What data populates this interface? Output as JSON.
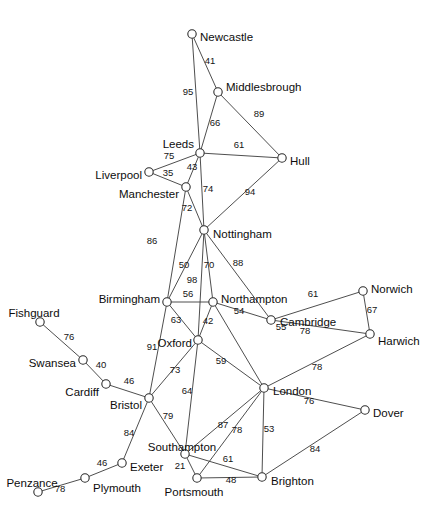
{
  "graph": {
    "title": "UK cities network graph",
    "node_radius": 4.2,
    "colors": {
      "background": "#ffffff",
      "edge": "#3a3a3a",
      "node_fill": "#ffffff",
      "node_stroke": "#2b2b2b",
      "label_text": "#0d0d0d",
      "weight_text": "#141414"
    },
    "nodes": [
      {
        "id": "newcastle",
        "label": "Newcastle",
        "x": 192,
        "y": 34,
        "lx": 200,
        "ly": 38,
        "anchor": "start"
      },
      {
        "id": "middlesbrough",
        "label": "Middlesbrough",
        "x": 218,
        "y": 92,
        "lx": 226,
        "ly": 88,
        "anchor": "start"
      },
      {
        "id": "leeds",
        "label": "Leeds",
        "x": 200,
        "y": 153,
        "lx": 194,
        "ly": 145,
        "anchor": "end"
      },
      {
        "id": "hull",
        "label": "Hull",
        "x": 282,
        "y": 158,
        "lx": 290,
        "ly": 162,
        "anchor": "start"
      },
      {
        "id": "liverpool",
        "label": "Liverpool",
        "x": 149,
        "y": 172,
        "lx": 142,
        "ly": 176,
        "anchor": "end"
      },
      {
        "id": "manchester",
        "label": "Manchester",
        "x": 186,
        "y": 187,
        "lx": 179,
        "ly": 195,
        "anchor": "end"
      },
      {
        "id": "nottingham",
        "label": "Nottingham",
        "x": 204,
        "y": 230,
        "lx": 213,
        "ly": 235,
        "anchor": "start"
      },
      {
        "id": "birmingham",
        "label": "Birmingham",
        "x": 167,
        "y": 302,
        "lx": 160,
        "ly": 300,
        "anchor": "end"
      },
      {
        "id": "northampton",
        "label": "Northampton",
        "x": 213,
        "y": 302,
        "lx": 221,
        "ly": 300,
        "anchor": "start"
      },
      {
        "id": "cambridge",
        "label": "Cambridge",
        "x": 271,
        "y": 320,
        "lx": 280,
        "ly": 323,
        "anchor": "start"
      },
      {
        "id": "norwich",
        "label": "Norwich",
        "x": 363,
        "y": 291,
        "lx": 371,
        "ly": 290,
        "anchor": "start"
      },
      {
        "id": "harwich",
        "label": "Harwich",
        "x": 370,
        "y": 334,
        "lx": 378,
        "ly": 342,
        "anchor": "start"
      },
      {
        "id": "oxford",
        "label": "Oxford",
        "x": 198,
        "y": 340,
        "lx": 192,
        "ly": 344,
        "anchor": "end"
      },
      {
        "id": "fishguard",
        "label": "Fishguard",
        "x": 40,
        "y": 322,
        "lx": 34,
        "ly": 314,
        "anchor": "middle"
      },
      {
        "id": "swansea",
        "label": "Swansea",
        "x": 83,
        "y": 360,
        "lx": 76,
        "ly": 364,
        "anchor": "end"
      },
      {
        "id": "cardiff",
        "label": "Cardiff",
        "x": 106,
        "y": 384,
        "lx": 99,
        "ly": 393,
        "anchor": "end"
      },
      {
        "id": "bristol",
        "label": "Bristol",
        "x": 149,
        "y": 398,
        "lx": 142,
        "ly": 406,
        "anchor": "end"
      },
      {
        "id": "london",
        "label": "London",
        "x": 264,
        "y": 388,
        "lx": 273,
        "ly": 392,
        "anchor": "start"
      },
      {
        "id": "dover",
        "label": "Dover",
        "x": 365,
        "y": 410,
        "lx": 373,
        "ly": 414,
        "anchor": "start"
      },
      {
        "id": "southampton",
        "label": "Southampton",
        "x": 185,
        "y": 454,
        "lx": 182,
        "ly": 448,
        "anchor": "middle"
      },
      {
        "id": "portsmouth",
        "label": "Portsmouth",
        "x": 197,
        "y": 478,
        "lx": 194,
        "ly": 493,
        "anchor": "middle"
      },
      {
        "id": "brighton",
        "label": "Brighton",
        "x": 262,
        "y": 477,
        "lx": 271,
        "ly": 482,
        "anchor": "start"
      },
      {
        "id": "exeter",
        "label": "Exeter",
        "x": 122,
        "y": 463,
        "lx": 130,
        "ly": 468,
        "anchor": "start"
      },
      {
        "id": "plymouth",
        "label": "Plymouth",
        "x": 85,
        "y": 478,
        "lx": 93,
        "ly": 489,
        "anchor": "start"
      },
      {
        "id": "penzance",
        "label": "Penzance",
        "x": 38,
        "y": 492,
        "lx": 32,
        "ly": 484,
        "anchor": "middle"
      }
    ],
    "edges": [
      {
        "from": "newcastle",
        "to": "middlesbrough",
        "weight": "41",
        "wx": 210,
        "wy": 64
      },
      {
        "from": "newcastle",
        "to": "leeds",
        "weight": "95",
        "wx": 188,
        "wy": 95
      },
      {
        "from": "middlesbrough",
        "to": "leeds",
        "weight": "66",
        "wx": 215,
        "wy": 126
      },
      {
        "from": "middlesbrough",
        "to": "hull",
        "weight": "89",
        "wx": 259,
        "wy": 117
      },
      {
        "from": "leeds",
        "to": "hull",
        "weight": "61",
        "wx": 239,
        "wy": 148
      },
      {
        "from": "leeds",
        "to": "liverpool",
        "weight": "75",
        "wx": 169,
        "wy": 159
      },
      {
        "from": "leeds",
        "to": "manchester",
        "weight": "43",
        "wx": 192,
        "wy": 170
      },
      {
        "from": "liverpool",
        "to": "manchester",
        "weight": "35",
        "wx": 168,
        "wy": 176
      },
      {
        "from": "leeds",
        "to": "nottingham",
        "weight": "74",
        "wx": 208,
        "wy": 192
      },
      {
        "from": "hull",
        "to": "nottingham",
        "weight": "94",
        "wx": 250,
        "wy": 195
      },
      {
        "from": "manchester",
        "to": "nottingham",
        "weight": "72",
        "wx": 187,
        "wy": 211
      },
      {
        "from": "manchester",
        "to": "birmingham",
        "weight": "86",
        "wx": 152,
        "wy": 244
      },
      {
        "from": "nottingham",
        "to": "birmingham",
        "weight": "50",
        "wx": 184,
        "wy": 268
      },
      {
        "from": "nottingham",
        "to": "oxford",
        "weight": "98",
        "wx": 192,
        "wy": 283
      },
      {
        "from": "nottingham",
        "to": "northampton",
        "weight": "70",
        "wx": 209,
        "wy": 268
      },
      {
        "from": "nottingham",
        "to": "cambridge",
        "weight": "88",
        "wx": 238,
        "wy": 266
      },
      {
        "from": "birmingham",
        "to": "northampton",
        "weight": "56",
        "wx": 188,
        "wy": 297
      },
      {
        "from": "birmingham",
        "to": "bristol",
        "weight": "91",
        "wx": 152,
        "wy": 350
      },
      {
        "from": "birmingham",
        "to": "oxford",
        "weight": "63",
        "wx": 176,
        "wy": 323
      },
      {
        "from": "northampton",
        "to": "oxford",
        "weight": "42",
        "wx": 208,
        "wy": 324
      },
      {
        "from": "northampton",
        "to": "cambridge",
        "weight": "54",
        "wx": 239,
        "wy": 314
      },
      {
        "from": "northampton",
        "to": "london",
        "weight": "55",
        "wx": 281,
        "wy": 330
      },
      {
        "from": "oxford",
        "to": "london",
        "weight": "59",
        "wx": 221,
        "wy": 364
      },
      {
        "from": "oxford",
        "to": "bristol",
        "weight": "73",
        "wx": 175,
        "wy": 373
      },
      {
        "from": "oxford",
        "to": "southampton",
        "weight": "64",
        "wx": 187,
        "wy": 394
      },
      {
        "from": "cambridge",
        "to": "norwich",
        "weight": "61",
        "wx": 313,
        "wy": 297
      },
      {
        "from": "cambridge",
        "to": "harwich",
        "weight": "78",
        "wx": 305,
        "wy": 334
      },
      {
        "from": "norwich",
        "to": "harwich",
        "weight": "67",
        "wx": 372,
        "wy": 313
      },
      {
        "from": "harwich",
        "to": "london",
        "weight": "78",
        "wx": 317,
        "wy": 370
      },
      {
        "from": "fishguard",
        "to": "swansea",
        "weight": "76",
        "wx": 69,
        "wy": 340
      },
      {
        "from": "swansea",
        "to": "cardiff",
        "weight": "40",
        "wx": 101,
        "wy": 368
      },
      {
        "from": "cardiff",
        "to": "bristol",
        "weight": "46",
        "wx": 129,
        "wy": 384
      },
      {
        "from": "bristol",
        "to": "southampton",
        "weight": "79",
        "wx": 168,
        "wy": 419
      },
      {
        "from": "bristol",
        "to": "exeter",
        "weight": "84",
        "wx": 129,
        "wy": 436
      },
      {
        "from": "exeter",
        "to": "plymouth",
        "weight": "46",
        "wx": 102,
        "wy": 466
      },
      {
        "from": "plymouth",
        "to": "penzance",
        "weight": "78",
        "wx": 60,
        "wy": 492
      },
      {
        "from": "southampton",
        "to": "portsmouth",
        "weight": "21",
        "wx": 180,
        "wy": 469
      },
      {
        "from": "southampton",
        "to": "london",
        "weight": "87",
        "wx": 223,
        "wy": 428
      },
      {
        "from": "southampton",
        "to": "brighton",
        "weight": "61",
        "wx": 228,
        "wy": 462
      },
      {
        "from": "portsmouth",
        "to": "london",
        "weight": "78",
        "wx": 237,
        "wy": 433
      },
      {
        "from": "portsmouth",
        "to": "brighton",
        "weight": "48",
        "wx": 231,
        "wy": 483
      },
      {
        "from": "london",
        "to": "brighton",
        "weight": "53",
        "wx": 269,
        "wy": 432
      },
      {
        "from": "london",
        "to": "dover",
        "weight": "76",
        "wx": 309,
        "wy": 404
      },
      {
        "from": "dover",
        "to": "brighton",
        "weight": "84",
        "wx": 315,
        "wy": 452
      }
    ]
  }
}
